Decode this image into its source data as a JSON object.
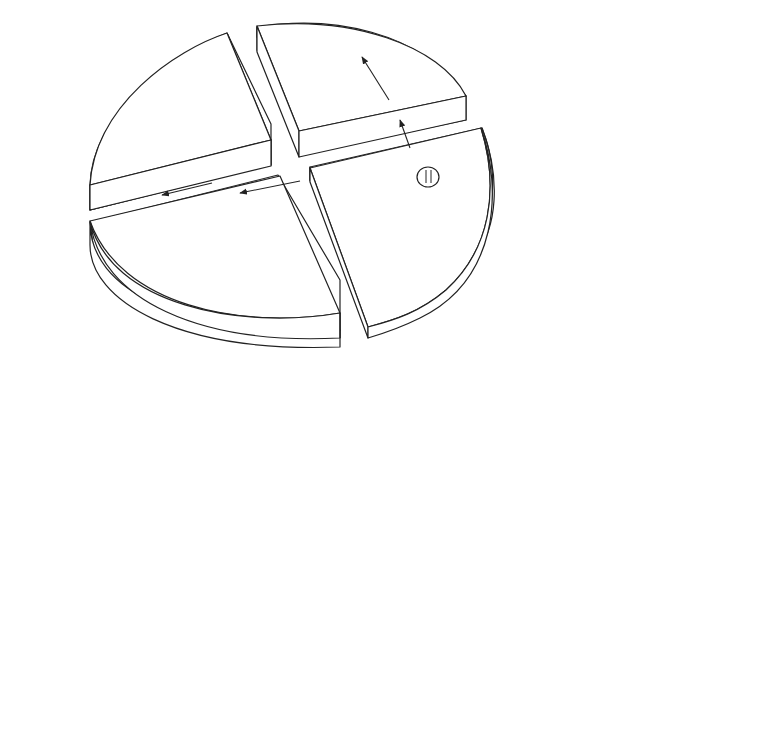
{
  "top_diagram": {
    "label_cooling_line1": "Cooling air",
    "label_cooling_line2": "flow direction",
    "label_insulation_line1": "Quartz wool",
    "label_insulation_line2": "insulation"
  },
  "bottom_left": {
    "caption": "Outward from center"
  },
  "bottom_right": {
    "caption": "Upward from bottom"
  },
  "colors": {
    "stroke": "#222222",
    "background": "#ffffff"
  }
}
